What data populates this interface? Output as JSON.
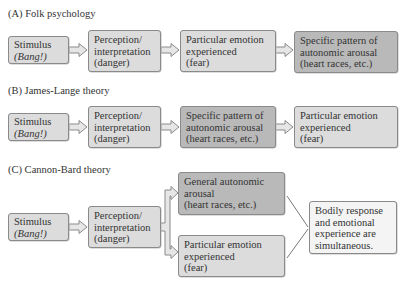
{
  "panels": {
    "A": {
      "title": "(A)  Folk psychology",
      "boxes": [
        {
          "lines": [
            "Stimulus",
            "(Bang!)"
          ]
        },
        {
          "lines": [
            "Perception/",
            "interpretation",
            "(danger)"
          ]
        },
        {
          "lines": [
            "Particular emotion",
            "experienced",
            "(fear)"
          ]
        },
        {
          "lines": [
            "Specific pattern of",
            "autonomic arousal",
            "(heart races, etc.)"
          ]
        }
      ]
    },
    "B": {
      "title": "(B)  James-Lange theory",
      "boxes": [
        {
          "lines": [
            "Stimulus",
            "(Bang!)"
          ]
        },
        {
          "lines": [
            "Perception/",
            "interpretation",
            "(danger)"
          ]
        },
        {
          "lines": [
            "Specific pattern of",
            "autonomic arousal",
            "(heart races, etc.)"
          ]
        },
        {
          "lines": [
            "Particular emotion",
            "experienced",
            "(fear)"
          ]
        }
      ]
    },
    "C": {
      "title": "(C)  Cannon-Bard theory",
      "boxes": [
        {
          "lines": [
            "Stimulus",
            "(Bang!)"
          ]
        },
        {
          "lines": [
            "Perception/",
            "interpretation",
            "(danger)"
          ]
        },
        {
          "lines": [
            "General autonomic",
            "arousal",
            "(heart races, etc.)"
          ]
        },
        {
          "lines": [
            "Particular emotion",
            "experienced",
            "(fear)"
          ]
        },
        {
          "lines": [
            "Bodily response",
            "and emotional",
            "experience are",
            "simultaneous."
          ]
        }
      ]
    }
  },
  "colors": {
    "box_fill": "#dcdcdc",
    "box_fill_dark": "#b9b9b9",
    "box_fill_light": "#f4f4f4",
    "border": "#8a8a8a"
  }
}
